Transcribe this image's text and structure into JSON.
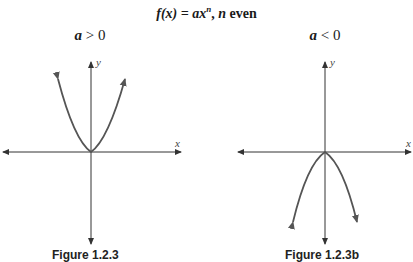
{
  "title": {
    "func": "f(x) = ax",
    "exponent": "n",
    "rest": ", ",
    "n": "n",
    "even": " even"
  },
  "panels": [
    {
      "condition_var": "a",
      "condition_rest": " > 0",
      "x_label": "x",
      "y_label": "y",
      "shape": "parabola opening upward",
      "caption": "Figure 1.2.3"
    },
    {
      "condition_var": "a",
      "condition_rest": " < 0",
      "x_label": "x",
      "y_label": "y",
      "shape": "parabola opening downward",
      "caption": "Figure 1.2.3b"
    }
  ],
  "colors": {
    "axis": "#333333",
    "curve": "#555555"
  }
}
